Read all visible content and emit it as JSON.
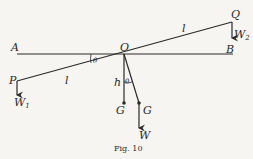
{
  "figure": {
    "caption": "Fig. 10",
    "labels": {
      "A": "A",
      "B": "B",
      "O": "O",
      "P": "P",
      "Q": "Q",
      "l_left": "l",
      "l_right": "l",
      "theta_top": "θ",
      "theta_bottom": "θ",
      "h": "h",
      "G_left": "G",
      "G_right": "G",
      "W": "W",
      "W1_main": "W",
      "W1_sub": "1",
      "W2_main": "W",
      "W2_sub": "2"
    },
    "colors": {
      "ink": "#2a2a2a",
      "paper": "#f6f5f2"
    }
  }
}
